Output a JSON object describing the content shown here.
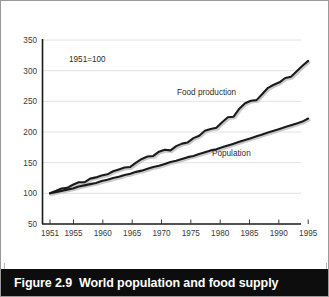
{
  "figure": {
    "caption_number": "Figure 2.9",
    "caption_title": "World population and food supply",
    "annotation": "1951=100"
  },
  "chart_data": {
    "type": "line",
    "title": "World population and food supply",
    "annotation": "1951=100",
    "xlabel": "",
    "ylabel": "",
    "xlim": [
      1951,
      1997
    ],
    "ylim": [
      50,
      350
    ],
    "xticks": [
      1951,
      1955,
      1960,
      1965,
      1970,
      1975,
      1980,
      1985,
      1990,
      1995
    ],
    "yticks": [
      50,
      100,
      150,
      200,
      250,
      300,
      350
    ],
    "grid": "horizontal",
    "legend": "inline-labels",
    "x": [
      1951,
      1952,
      1953,
      1954,
      1955,
      1956,
      1957,
      1958,
      1959,
      1960,
      1961,
      1962,
      1963,
      1964,
      1965,
      1966,
      1967,
      1968,
      1969,
      1970,
      1971,
      1972,
      1973,
      1974,
      1975,
      1976,
      1977,
      1978,
      1979,
      1980,
      1981,
      1982,
      1983,
      1984,
      1985,
      1986,
      1987,
      1988,
      1989,
      1990,
      1991,
      1992,
      1993,
      1994,
      1995,
      1996
    ],
    "series": [
      {
        "name": "Food production",
        "color": "#1a1a1a",
        "values": [
          100,
          104,
          108,
          109,
          114,
          118,
          118,
          124,
          126,
          129,
          131,
          136,
          139,
          142,
          143,
          150,
          156,
          160,
          161,
          168,
          171,
          170,
          177,
          181,
          183,
          190,
          194,
          202,
          205,
          207,
          216,
          224,
          225,
          238,
          247,
          251,
          252,
          262,
          272,
          277,
          281,
          288,
          290,
          299,
          308,
          316
        ]
      },
      {
        "name": "Population",
        "color": "#1a1a1a",
        "values": [
          100,
          102,
          104,
          106,
          108,
          111,
          113,
          115,
          117,
          120,
          122,
          125,
          127,
          130,
          132,
          135,
          137,
          140,
          143,
          145,
          148,
          151,
          153,
          156,
          159,
          161,
          164,
          167,
          170,
          172,
          175,
          178,
          181,
          184,
          187,
          190,
          193,
          196,
          199,
          202,
          205,
          208,
          211,
          214,
          217,
          222
        ]
      }
    ]
  }
}
